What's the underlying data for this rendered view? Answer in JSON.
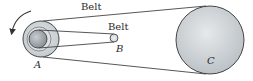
{
  "diagram": {
    "labels": {
      "outer_belt": "Belt",
      "inner_belt": "Belt",
      "pulley_a": "A",
      "pulley_b": "B",
      "pulley_c": "C"
    },
    "rotation_direction": "counterclockwise",
    "colors": {
      "stroke": "#333333",
      "pulley_fill_light": "#d9dde0",
      "pulley_fill_mid": "#b8bec3",
      "pulley_fill_dark": "#8d959c",
      "background": "#ffffff"
    }
  }
}
